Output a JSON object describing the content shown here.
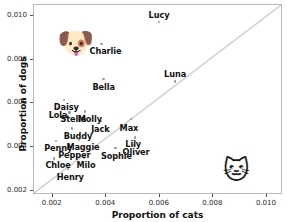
{
  "chart_data": {
    "type": "scatter",
    "title": "",
    "xlabel": "Proportion of cats",
    "ylabel": "Proportion of dogs",
    "xlim": [
      0.0013,
      0.0106
    ],
    "ylim": [
      0.0018,
      0.0105
    ],
    "grid": false,
    "legend": null,
    "reference_line": {
      "name": "identity-line",
      "description": "y = x diagonal",
      "color": "#d2d2d2",
      "from": [
        0.0013,
        0.0018
      ],
      "to": [
        0.0106,
        0.0105
      ]
    },
    "xticks": [
      "0.002",
      "0.004",
      "0.006",
      "0.008",
      "0.010"
    ],
    "xtick_values": [
      0.002,
      0.004,
      0.006,
      0.008,
      0.01
    ],
    "yticks": [
      "0.002",
      "0.004",
      "0.006",
      "0.008",
      "0.010"
    ],
    "ytick_values": [
      0.002,
      0.004,
      0.006,
      0.008,
      0.01
    ],
    "marker_color": "#9a9a9a",
    "points": [
      {
        "label": "Lucy",
        "x": 0.00597,
        "y": 0.00972,
        "label_dx": 0,
        "label_dy": -11
      },
      {
        "label": "Charlie",
        "x": 0.00382,
        "y": 0.00872,
        "label_dx": 4,
        "label_dy": 3
      },
      {
        "label": "Luna",
        "x": 0.00657,
        "y": 0.007,
        "label_dx": 0,
        "label_dy": -11
      },
      {
        "label": "Bella",
        "x": 0.0039,
        "y": 0.00712,
        "label_dx": 0,
        "label_dy": 4
      },
      {
        "label": "Daisy",
        "x": 0.00243,
        "y": 0.00616,
        "label_dx": 2,
        "label_dy": 3
      },
      {
        "label": "Lola",
        "x": 0.0022,
        "y": 0.00578,
        "label_dx": 0,
        "label_dy": 3
      },
      {
        "label": "Stella",
        "x": 0.00262,
        "y": 0.00558,
        "label_dx": 4,
        "label_dy": 3
      },
      {
        "label": "Molly",
        "x": 0.0032,
        "y": 0.00562,
        "label_dx": 5,
        "label_dy": 3
      },
      {
        "label": "Jack",
        "x": 0.00378,
        "y": 0.0052,
        "label_dx": 0,
        "label_dy": 4
      },
      {
        "label": "Max",
        "x": 0.00492,
        "y": 0.00528,
        "label_dx": -2,
        "label_dy": 5
      },
      {
        "label": "Buddy",
        "x": 0.00272,
        "y": 0.00484,
        "label_dx": 6,
        "label_dy": 3
      },
      {
        "label": "Penny",
        "x": 0.00213,
        "y": 0.00428,
        "label_dx": 2,
        "label_dy": 3
      },
      {
        "label": "Maggie",
        "x": 0.00298,
        "y": 0.00432,
        "label_dx": 4,
        "label_dy": 3
      },
      {
        "label": "Lily",
        "x": 0.00508,
        "y": 0.00444,
        "label_dx": -2,
        "label_dy": 3
      },
      {
        "label": "Oliver",
        "x": 0.005,
        "y": 0.00408,
        "label_dx": 3,
        "label_dy": 3
      },
      {
        "label": "Pepper",
        "x": 0.00262,
        "y": 0.004,
        "label_dx": 5,
        "label_dy": 4
      },
      {
        "label": "Sophie",
        "x": 0.00434,
        "y": 0.00396,
        "label_dx": 1,
        "label_dy": 4
      },
      {
        "label": "Chloe",
        "x": 0.00205,
        "y": 0.00348,
        "label_dx": 4,
        "label_dy": 3
      },
      {
        "label": "Milo",
        "x": 0.00317,
        "y": 0.00352,
        "label_dx": 2,
        "label_dy": 4
      },
      {
        "label": "Henry",
        "x": 0.00258,
        "y": 0.003,
        "label_dx": 2,
        "label_dy": 4
      }
    ],
    "annotations": [
      {
        "name": "dog-face-emoji",
        "glyph": "🐶",
        "x": 0.00284,
        "y": 0.00878
      },
      {
        "name": "cat-face-emoji",
        "glyph": "🐱",
        "x": 0.00886,
        "y": 0.00296
      }
    ]
  }
}
